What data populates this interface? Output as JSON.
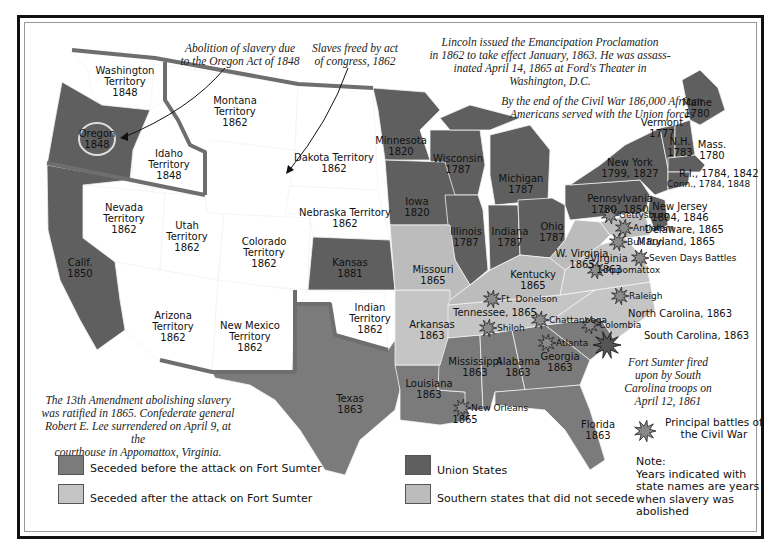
{
  "colors": {
    "seceded_before": "#7b7b7b",
    "seceded_after": "#c5c5c5",
    "union": "#5f5f5f",
    "did_not_secede": "#bcbcbc",
    "territory": "#ffffff",
    "border_thick": "#6e6e6e"
  },
  "annotations": {
    "oregon_act": "Abolition of slavery due\nto the Oregon Act of 1848",
    "act_of_congress": "Slaves freed by act\nof congress, 1862",
    "lincoln": "Lincoln issued the Emancipation Proclamation\nin 1862 to take effect January, 1863. He was assass-\ninated April 14, 1865 at Ford's Theater in\nWashington, D.C.",
    "african_americans": "By the end of the Civil War 186,000 African\nAmericans served with the Union forces",
    "thirteenth": "The 13th Amendment abolishing slavery\nwas ratified in 1865. Confederate general\nRobert E. Lee surrendered on April 9, at the\ncourthouse in Appomattox, Virginia.",
    "fort_sumter": "Fort Sumter fired\nupon by South\nCarolina troops on\nApril 12, 1861"
  },
  "regions": {
    "washington": "Washington\nTerritory\n1848",
    "oregon": "Oregon\n1848",
    "idaho": "Idaho\nTerritory\n1848",
    "montana": "Montana\nTerritory\n1862",
    "dakota": "Dakota Territory\n1862",
    "nebraska": "Nebraska Territory\n1862",
    "nevada": "Nevada\nTerritory\n1862",
    "utah": "Utah\nTerritory\n1862",
    "colorado": "Colorado\nTerritory\n1862",
    "california": "Calif.\n1850",
    "arizona": "Arizona\nTerritory\n1862",
    "new_mexico": "New Mexico\nTerritory\n1862",
    "kansas": "Kansas\n1881",
    "indian": "Indian\nTerritory\n1862",
    "texas": "Texas\n1863",
    "minnesota": "Minnesota\n1820",
    "wisconsin": "Wisconsin\n1787",
    "michigan": "Michigan\n1787",
    "iowa": "Iowa\n1820",
    "illinois": "Illinois\n1787",
    "indiana": "Indiana\n1787",
    "ohio": "Ohio\n1787",
    "missouri": "Missouri\n1865",
    "kentucky": "Kentucky\n1865",
    "tennessee": "Tennessee, 1865",
    "arkansas": "Arkansas\n1863",
    "louisiana": "Louisiana\n1863",
    "louisiana_1865": "1865",
    "mississippi": "Mississippi\n1863",
    "alabama": "Alabama\n1863",
    "georgia": "Georgia\n1863",
    "florida": "Florida\n1863",
    "south_carolina": "South Carolina, 1863",
    "north_carolina": "North Carolina, 1863",
    "virginia": "Virginia\n1863",
    "west_virginia": "W. Virginia\n1865",
    "maryland": "Maryland, 1865",
    "delaware": "Delaware, 1865",
    "new_jersey": "New Jersey\n1804, 1846",
    "pennsylvania": "Pennsylvania\n1780, 1850",
    "new_york": "New York\n1799, 1827",
    "connecticut": "Conn., 1784, 1848",
    "rhode_island": "R.I., 1784, 1842",
    "massachusetts": "Mass.\n1780",
    "new_hampshire": "N.H.\n1783",
    "vermont": "Vermont\n1777",
    "maine": "Maine\n1780"
  },
  "battles": [
    {
      "name": "Gettysburg",
      "x": 610,
      "y": 215
    },
    {
      "name": "Antietam",
      "x": 624,
      "y": 228
    },
    {
      "name": "Bull Run",
      "x": 618,
      "y": 242
    },
    {
      "name": "Seven Days Battles",
      "x": 640,
      "y": 258
    },
    {
      "name": "Appomattox",
      "x": 596,
      "y": 270
    },
    {
      "name": "Raleigh",
      "x": 620,
      "y": 296
    },
    {
      "name": "Ft. Donelson",
      "x": 492,
      "y": 299
    },
    {
      "name": "Chattanooga",
      "x": 540,
      "y": 320
    },
    {
      "name": "Colombia",
      "x": 590,
      "y": 325
    },
    {
      "name": "Shiloh",
      "x": 488,
      "y": 328
    },
    {
      "name": "Atlanta",
      "x": 547,
      "y": 343
    },
    {
      "name": "New Orleans",
      "x": 462,
      "y": 408
    }
  ],
  "fort_sumter_marker": {
    "x": 607,
    "y": 345
  },
  "legend": {
    "items": [
      {
        "label": "Seceded before the attack on Fort Sumter",
        "key": "seceded_before"
      },
      {
        "label": "Seceded after the attack on Fort Sumter",
        "key": "seceded_after"
      },
      {
        "label": "Union States",
        "key": "union"
      },
      {
        "label": "Southern states that did not secede",
        "key": "did_not_secede"
      }
    ],
    "battle_label": "Principal battles of\nthe Civil War",
    "note": "Note:\nYears indicated with\nstate names are years\nwhen slavery was\nabolished"
  }
}
